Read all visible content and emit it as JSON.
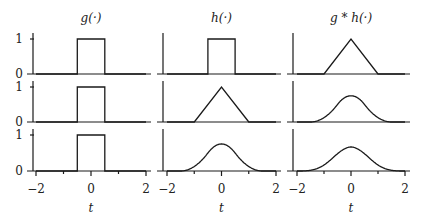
{
  "chart_data": {
    "type": "line",
    "layout": "3 rows x 3 columns grid of small plots",
    "columns": [
      {
        "title": "g(·)",
        "math": "g(\\cdot)"
      },
      {
        "title": "h(·)",
        "math": "h(\\cdot)"
      },
      {
        "title": "g * h(·)",
        "math": "g * h(\\cdot)"
      }
    ],
    "xlabel": "t",
    "xlim": [
      -2,
      2
    ],
    "xticks": [
      -2,
      -1,
      0,
      1,
      2
    ],
    "xticklabels": [
      "−2",
      "0",
      "2"
    ],
    "ylim": [
      0,
      1
    ],
    "yticks": [
      0,
      1
    ],
    "yticklabels": [
      "0",
      "1"
    ],
    "grid": false,
    "legend": null,
    "rows": [
      {
        "g": {
          "shape": "box",
          "x": [
            -2,
            -0.5,
            -0.5,
            0.5,
            0.5,
            2
          ],
          "y": [
            0,
            0,
            1,
            1,
            0,
            0
          ]
        },
        "h": {
          "shape": "box",
          "x": [
            -2,
            -0.5,
            -0.5,
            0.5,
            0.5,
            2
          ],
          "y": [
            0,
            0,
            1,
            1,
            0,
            0
          ]
        },
        "g_conv_h": {
          "shape": "triangle",
          "x": [
            -2,
            -1,
            0,
            1,
            2
          ],
          "y": [
            0,
            0,
            1,
            0,
            0
          ]
        }
      },
      {
        "g": {
          "shape": "box",
          "x": [
            -2,
            -0.5,
            -0.5,
            0.5,
            0.5,
            2
          ],
          "y": [
            0,
            0,
            1,
            1,
            0,
            0
          ]
        },
        "h": {
          "shape": "triangle",
          "x": [
            -2,
            -1,
            0,
            1,
            2
          ],
          "y": [
            0,
            0,
            1,
            0,
            0
          ]
        },
        "g_conv_h": {
          "shape": "quadratic B-spline",
          "x": [
            -1.5,
            -1,
            -0.5,
            0,
            0.5,
            1,
            1.5
          ],
          "y": [
            0,
            0.125,
            0.5,
            0.75,
            0.5,
            0.125,
            0
          ]
        }
      },
      {
        "g": {
          "shape": "box",
          "x": [
            -2,
            -0.5,
            -0.5,
            0.5,
            0.5,
            2
          ],
          "y": [
            0,
            0,
            1,
            1,
            0,
            0
          ]
        },
        "h": {
          "shape": "quadratic B-spline",
          "x": [
            -1.5,
            -1,
            -0.5,
            0,
            0.5,
            1,
            1.5
          ],
          "y": [
            0,
            0.125,
            0.5,
            0.75,
            0.5,
            0.125,
            0
          ]
        },
        "g_conv_h": {
          "shape": "cubic B-spline",
          "x": [
            -2,
            -1.5,
            -1,
            -0.5,
            0,
            0.5,
            1,
            1.5,
            2
          ],
          "y": [
            0,
            0.0208,
            0.1667,
            0.4792,
            0.6667,
            0.4792,
            0.1667,
            0.0208,
            0
          ]
        }
      }
    ]
  }
}
